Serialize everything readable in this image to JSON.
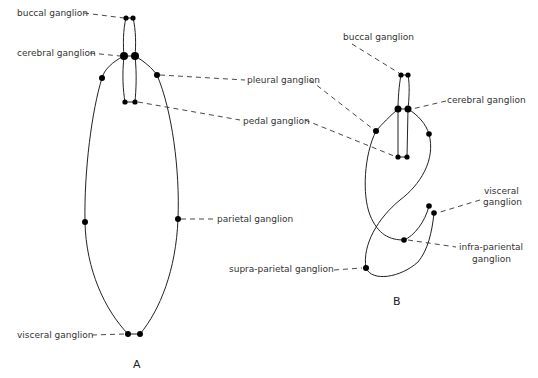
{
  "diagram": {
    "panel_a": {
      "caption": "A",
      "labels": {
        "buccal": "buccal ganglion",
        "cerebral": "cerebral ganglion",
        "pleural": "pleural ganglion",
        "pedal": "pedal ganglion",
        "parietal": "parietal ganglion",
        "visceral": "visceral ganglion"
      }
    },
    "panel_b": {
      "caption": "B",
      "labels": {
        "buccal": "buccal ganglion",
        "cerebral": "cerebral ganglion",
        "visceral_1": "visceral",
        "visceral_2": "ganglion",
        "infra_1": "infra-pariental",
        "infra_2": "ganglion",
        "supra": "supra-parietal ganglion"
      }
    },
    "colors": {
      "line": "#222222",
      "node": "#000000",
      "background": "#ffffff"
    }
  }
}
